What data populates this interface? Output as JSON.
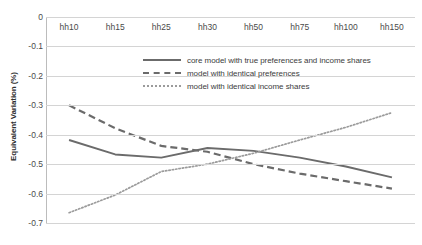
{
  "chart_data": {
    "type": "line",
    "title": "",
    "xlabel": "",
    "ylabel": "Equivalent Variation (%)",
    "categories": [
      "hh10",
      "hh15",
      "hh25",
      "hh30",
      "hh50",
      "hh75",
      "hh100",
      "hh150"
    ],
    "ylim": [
      -0.7,
      0
    ],
    "yticks": [
      "0",
      "-0.1",
      "-0.2",
      "-0.3",
      "-0.4",
      "-0.5",
      "-0.6",
      "-0.7"
    ],
    "ytick_values": [
      0,
      -0.1,
      -0.2,
      -0.3,
      -0.4,
      -0.5,
      -0.6,
      -0.7
    ],
    "grid": true,
    "legend_position": "upper-center",
    "series": [
      {
        "name": "core model with true preferences and income shares",
        "style": "solid",
        "color": "#6b6b6b",
        "values": [
          -0.418,
          -0.467,
          -0.478,
          -0.445,
          -0.455,
          -0.478,
          -0.508,
          -0.545
        ]
      },
      {
        "name": "model with identical preferences",
        "style": "dashed",
        "color": "#6b6b6b",
        "values": [
          -0.3,
          -0.378,
          -0.438,
          -0.458,
          -0.5,
          -0.532,
          -0.558,
          -0.583
        ]
      },
      {
        "name": "model with identical income shares",
        "style": "dotted",
        "color": "#9b9b9b",
        "values": [
          -0.665,
          -0.605,
          -0.525,
          -0.5,
          -0.463,
          -0.418,
          -0.375,
          -0.325
        ]
      }
    ]
  },
  "axis": {
    "y_title": "Equivalent Variation (%)"
  },
  "legend": {
    "entries": [
      "core model with true preferences and income shares",
      "model with identical preferences",
      "model with identical income shares"
    ]
  }
}
